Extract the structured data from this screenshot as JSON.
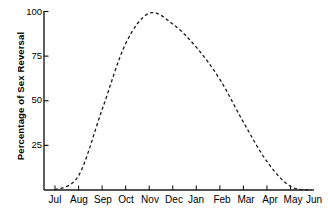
{
  "chart_data": {
    "type": "line",
    "title": "",
    "subtitle": "",
    "xlabel": "",
    "ylabel": "Percentage of Sex Reversal",
    "ylim": [
      0,
      100
    ],
    "ytick_labels": [
      "100",
      "75",
      "50",
      "25"
    ],
    "ytick_values": [
      100,
      75,
      50,
      25
    ],
    "categories": [
      "Jul",
      "Aug",
      "Sep",
      "Oct",
      "Nov",
      "Dec",
      "Jan",
      "Feb",
      "Mar",
      "Apr",
      "May",
      "Jun"
    ],
    "grid": false,
    "legend": null,
    "line_style": "dashed",
    "line_color": "#1a1a1a",
    "axis_color": "#1a1a1a",
    "background_color": "#ffffff",
    "series": [
      {
        "name": "Percentage of Sex Reversal",
        "values": [
          0,
          8,
          45,
          82,
          99,
          93,
          80,
          62,
          38,
          16,
          2,
          0
        ]
      }
    ],
    "points": [
      {
        "x": "Jul",
        "y": 0
      },
      {
        "x": "Aug",
        "y": 8
      },
      {
        "x": "Sep",
        "y": 45
      },
      {
        "x": "Oct",
        "y": 82
      },
      {
        "x": "Nov",
        "y": 99
      },
      {
        "x": "Dec",
        "y": 93
      },
      {
        "x": "Jan",
        "y": 80
      },
      {
        "x": "Feb",
        "y": 62
      },
      {
        "x": "Mar",
        "y": 38
      },
      {
        "x": "Apr",
        "y": 16
      },
      {
        "x": "May",
        "y": 2
      },
      {
        "x": "Jun",
        "y": 0
      }
    ],
    "annotations": []
  },
  "axes": {
    "y_title": "Percentage of Sex Reversal",
    "y_ticks": [
      {
        "label": "100",
        "value": 100
      },
      {
        "label": "75",
        "value": 75
      },
      {
        "label": "50",
        "value": 50
      },
      {
        "label": "25",
        "value": 25
      }
    ],
    "x_ticks": [
      {
        "label": "Jul"
      },
      {
        "label": "Aug"
      },
      {
        "label": "Sep"
      },
      {
        "label": "Oct"
      },
      {
        "label": "Nov"
      },
      {
        "label": "Dec"
      },
      {
        "label": "Jan"
      },
      {
        "label": "Feb"
      },
      {
        "label": "Mar"
      },
      {
        "label": "Apr"
      },
      {
        "label": "May"
      },
      {
        "label": "Jun"
      }
    ]
  }
}
